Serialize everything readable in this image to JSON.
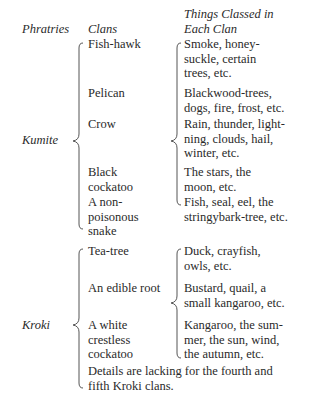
{
  "headers": {
    "phratries": "Phratries",
    "clans": "Clans",
    "things": "Things Classed in\nEach Clan"
  },
  "phratries": [
    {
      "name": "Kumite",
      "clans": [
        {
          "clan": "Fish-hawk",
          "things": "Smoke, honey-\nsuckle, certain\ntrees, etc."
        },
        {
          "clan": "Pelican",
          "things": "Blackwood-trees,\ndogs, fire, frost, etc."
        },
        {
          "clan": "Crow",
          "things": "Rain, thunder, light-\nning, clouds, hail,\nwinter, etc."
        },
        {
          "clan": "Black\ncockatoo",
          "things": "The stars, the\nmoon, etc."
        },
        {
          "clan": "A non-\npoisonous\nsnake",
          "things": "Fish, seal, eel, the\nstringybark-tree, etc."
        }
      ]
    },
    {
      "name": "Kroki",
      "clans": [
        {
          "clan": "Tea-tree",
          "things": "Duck, crayfish,\nowls, etc."
        },
        {
          "clan": "An edible root",
          "things": "Bustard, quail, a\nsmall kangaroo, etc."
        },
        {
          "clan": "A white\ncrestless\ncockatoo",
          "things": "Kangaroo, the sum-\nmer, the sun, wind,\nthe autumn, etc."
        }
      ],
      "note": "Details are lacking for the fourth and\nfifth Kroki clans."
    }
  ]
}
